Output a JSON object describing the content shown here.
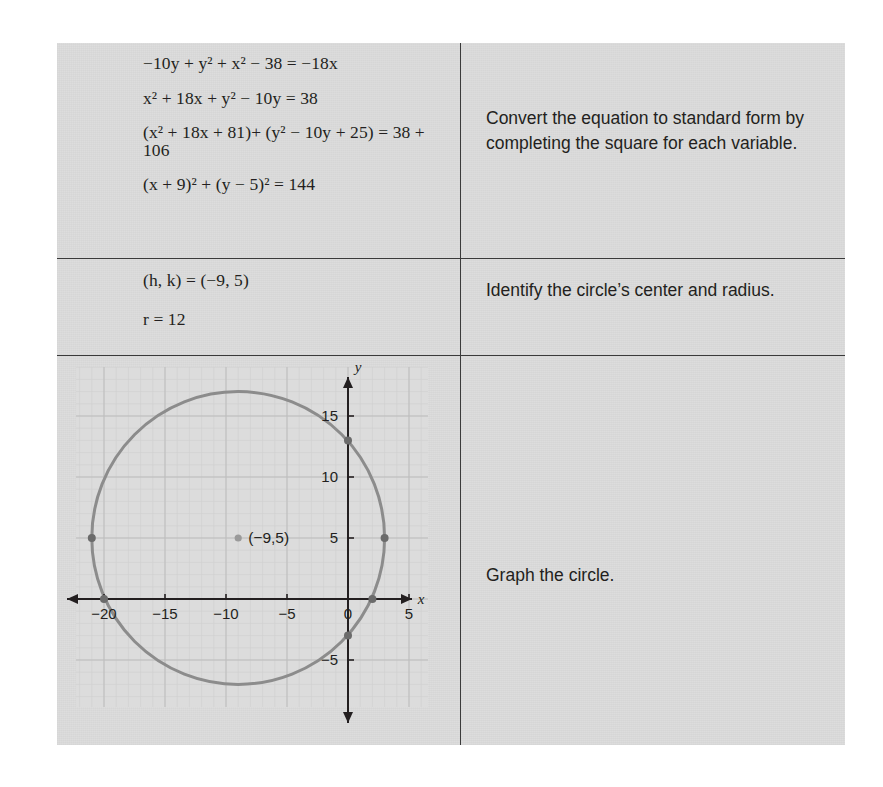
{
  "table": {
    "rows": [
      {
        "work": [
          "−10y + y² + x² − 38 = −18x",
          "x² + 18x + y² − 10y = 38",
          "(x² + 18x + 81)+ (y² − 10y + 25) = 38 + 106",
          "(x + 9)² + (y − 5)² = 144"
        ],
        "instruction": "Convert the equation to standard form by completing the square for each variable."
      },
      {
        "work": [
          "(h, k) = (−9, 5)",
          "r = 12"
        ],
        "instruction": "Identify the circle’s center and radius."
      },
      {
        "instruction": "Graph the circle."
      }
    ]
  },
  "chart_data": {
    "type": "scatter",
    "title": "",
    "xlabel": "x",
    "ylabel": "y",
    "xlim": [
      -23,
      6
    ],
    "ylim": [
      -8,
      19
    ],
    "grid": true,
    "grid_minor_step": 1,
    "grid_major_step": 5,
    "xticks": [
      -20,
      -15,
      -10,
      -5,
      0,
      5
    ],
    "xtick_labels": [
      "−20",
      "−15",
      "−10",
      "−5",
      "0",
      "5"
    ],
    "yticks": [
      -5,
      5,
      10,
      15
    ],
    "ytick_labels": [
      "5",
      "5",
      "10",
      "15"
    ],
    "ytick_display": [
      "−5",
      "5",
      "10",
      "15"
    ],
    "circle": {
      "center_x": -9,
      "center_y": 5,
      "radius": 12,
      "stroke": "#8c8c8c",
      "stroke_width": 3
    },
    "center_point": {
      "x": -9,
      "y": 5,
      "label": "(−9,5)"
    },
    "marked_points": [
      {
        "x": 3,
        "y": 5
      },
      {
        "x": -21,
        "y": 5
      },
      {
        "x": 0,
        "y": 13
      },
      {
        "x": 0,
        "y": -3
      },
      {
        "x": 2,
        "y": 0
      },
      {
        "x": -20,
        "y": 0
      }
    ],
    "point_color": "#6b6b6b",
    "axis_color": "#231f20",
    "plot_bg": "#dcdcdc"
  },
  "colors": {
    "page_bg": "#ffffff",
    "table_bg": "#dcdcdc",
    "rule": "#3a3a3a",
    "text": "#231f20",
    "curve": "#8c8c8c",
    "grid_minor": "#cfcfcf",
    "grid_major": "#bdbdbd"
  }
}
